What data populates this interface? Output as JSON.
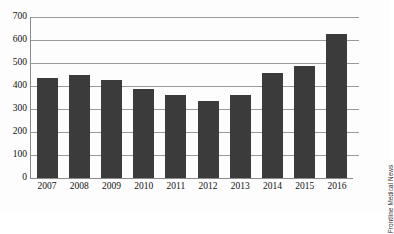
{
  "credit": "Frontline Medical News",
  "chart_data": {
    "type": "bar",
    "title": "",
    "subtitle": "",
    "xlabel": "",
    "ylabel": "",
    "categories": [
      "2007",
      "2008",
      "2009",
      "2010",
      "2011",
      "2012",
      "2013",
      "2014",
      "2015",
      "2016"
    ],
    "values": [
      435,
      448,
      428,
      387,
      360,
      335,
      360,
      455,
      487,
      627
    ],
    "series": [
      {
        "name": "count",
        "values": [
          435,
          448,
          428,
          387,
          360,
          335,
          360,
          455,
          487,
          627
        ]
      }
    ],
    "ylim": [
      0,
      700
    ],
    "yticks": [
      0,
      100,
      200,
      300,
      400,
      500,
      600,
      700
    ],
    "ytick_labels": [
      "0",
      "100",
      "200",
      "300",
      "400",
      "500",
      "600",
      "700"
    ],
    "grid": true,
    "legend": false,
    "legend_position": "none",
    "bar_color": "#3b3b3b",
    "grid_color": "#9a9a9a",
    "axis_color": "#8a8a8a",
    "background": "#fdfdfd"
  }
}
